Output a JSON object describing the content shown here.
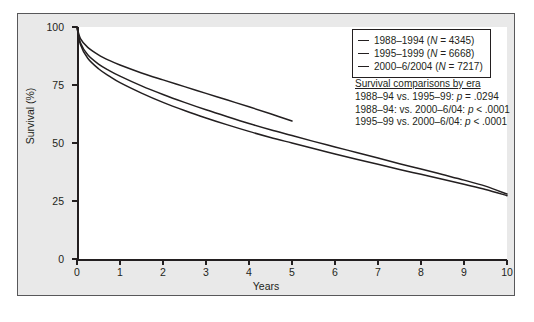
{
  "figure": {
    "background_color": "#e9e9e9",
    "plot_background_color": "#ffffff",
    "line_color": "#231f20"
  },
  "axes": {
    "y_title": "Survival (%)",
    "x_title": "Years",
    "y_ticks": [
      "0",
      "25",
      "50",
      "75",
      "100"
    ],
    "x_ticks": [
      "0",
      "1",
      "2",
      "3",
      "4",
      "5",
      "6",
      "7",
      "8",
      "9",
      "10"
    ]
  },
  "legend": {
    "entries": [
      {
        "era": "1988–1994",
        "n_prefix": "(",
        "n_symbol": "N",
        "n_value": " = 4345)"
      },
      {
        "era": "1995–1999",
        "n_prefix": "(",
        "n_symbol": "N",
        "n_value": " = 6668)"
      },
      {
        "era": "2000–6/2004",
        "n_prefix": "(",
        "n_symbol": "N",
        "n_value": " = 7217)"
      }
    ]
  },
  "stats": {
    "title": "Survival comparisons by era",
    "rows": [
      {
        "comparison": "1988–94 vs. 1995–99: ",
        "p_symbol": "p",
        "p_value": " = .0294"
      },
      {
        "comparison": "1988–94: vs. 2000–6/04: ",
        "p_symbol": "p",
        "p_value": " < .0001"
      },
      {
        "comparison": "1995–99 vs. 2000–6/04: ",
        "p_symbol": "p",
        "p_value": " < .0001"
      }
    ]
  },
  "chart_data": {
    "type": "line",
    "title": "",
    "xlabel": "Years",
    "ylabel": "Survival (%)",
    "xlim": [
      0,
      10
    ],
    "ylim": [
      0,
      100
    ],
    "grid": false,
    "legend_position": "top-right",
    "x": [
      0,
      0.08,
      0.25,
      0.5,
      0.75,
      1,
      1.5,
      2,
      2.5,
      3,
      3.5,
      4,
      4.5,
      5,
      5.5,
      6,
      6.5,
      7,
      7.5,
      8,
      8.5,
      9,
      9.5,
      10
    ],
    "series": [
      {
        "name": "1988–1994",
        "n": 4345,
        "values": [
          100,
          92.5,
          86.5,
          82.0,
          78.8,
          76.0,
          71.5,
          67.5,
          64.0,
          60.8,
          57.8,
          55.0,
          52.4,
          50.0,
          47.6,
          45.3,
          43.0,
          40.8,
          38.6,
          36.5,
          34.4,
          32.2,
          30.0,
          27.3
        ],
        "x_end": 10
      },
      {
        "name": "1995–1999",
        "n": 6668,
        "values": [
          100,
          93.2,
          88.0,
          84.0,
          81.2,
          78.8,
          74.6,
          70.9,
          67.5,
          64.3,
          61.3,
          58.4,
          55.7,
          53.2,
          50.7,
          48.3,
          45.9,
          43.5,
          41.1,
          38.8,
          36.4,
          34.0,
          31.4,
          28.0
        ],
        "x_end": 10
      },
      {
        "name": "2000–6/2004",
        "n": 7217,
        "values": [
          100,
          95.0,
          91.2,
          88.0,
          85.6,
          83.6,
          80.2,
          77.2,
          74.3,
          71.4,
          68.5,
          65.6,
          62.6,
          59.5,
          null,
          null,
          null,
          null,
          null,
          null,
          null,
          null,
          null,
          null
        ],
        "x_end": 5
      }
    ],
    "annotations": [
      "Survival comparisons by era",
      "1988–94 vs. 1995–99: p = .0294",
      "1988–94: vs. 2000–6/04: p < .0001",
      "1995–99 vs. 2000–6/04: p < .0001"
    ]
  }
}
